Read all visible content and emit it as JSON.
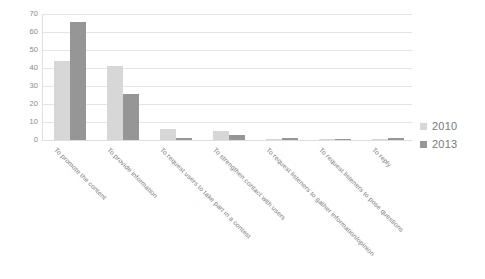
{
  "chart_data": {
    "type": "bar",
    "title": "",
    "subtitle": "",
    "xlabel": "",
    "ylabel": "",
    "ylim": [
      0,
      70
    ],
    "yticks": [
      0,
      10,
      20,
      30,
      40,
      50,
      60,
      70
    ],
    "ytick_labels": [
      "0",
      "10",
      "20",
      "30",
      "40",
      "50",
      "60",
      "70"
    ],
    "grid": true,
    "legend_position": "right",
    "categories": [
      "To promote the content",
      "To provide information",
      "To request users to take part in a contest",
      "To strengthen contact with users",
      "To request listeners to gather information/opinion",
      "To request listeners to pose questions",
      "To reply"
    ],
    "series": [
      {
        "name": "2010",
        "color": "#d7d7d7",
        "values": [
          44,
          41,
          6,
          5,
          0.5,
          0.4,
          0.3
        ]
      },
      {
        "name": "2013",
        "color": "#969696",
        "values": [
          65.5,
          25.5,
          1,
          3,
          1.3,
          0.3,
          1.3
        ]
      }
    ]
  },
  "legend": {
    "items": [
      {
        "label": "2010",
        "color": "#d7d7d7"
      },
      {
        "label": "2013",
        "color": "#969696"
      }
    ]
  }
}
